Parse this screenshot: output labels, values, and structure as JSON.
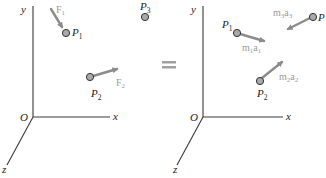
{
  "figure": {
    "equivalence_symbol": "equals-sign",
    "colors": {
      "axis": "#3a3a3a",
      "vector": "#8c8c8c",
      "vector_label": "#9a9a9a",
      "particle_fill": "#a9a9a9",
      "particle_stroke": "#333333",
      "text": "#222222"
    },
    "left_panel": {
      "axes": {
        "y": "y",
        "x": "x",
        "z": "z",
        "origin": "O"
      },
      "particles": [
        {
          "name": "P",
          "sub": "1"
        },
        {
          "name": "P",
          "sub": "2"
        },
        {
          "name": "P",
          "sub": "3"
        }
      ],
      "vectors": [
        {
          "name": "F",
          "sub": "1"
        },
        {
          "name": "F",
          "sub": "2"
        }
      ]
    },
    "right_panel": {
      "axes": {
        "y": "y",
        "x": "x",
        "z": "z",
        "origin": "O"
      },
      "particles": [
        {
          "name": "P",
          "sub": "1"
        },
        {
          "name": "P",
          "sub": "2"
        },
        {
          "name": "P",
          "sub": ""
        }
      ],
      "vectors": [
        {
          "m": "m",
          "msub": "1",
          "a": "a",
          "asub": "1"
        },
        {
          "m": "m",
          "msub": "2",
          "a": "a",
          "asub": "2"
        },
        {
          "m": "m",
          "msub": "3",
          "a": "a",
          "asub": "3"
        }
      ]
    }
  }
}
